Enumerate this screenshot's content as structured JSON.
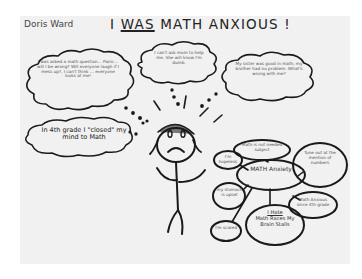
{
  "drawing": {
    "author": "Doris Ward",
    "title_prefix": "I ",
    "title_underlined": "WAS",
    "title_suffix": " MATH ANXIOUS !",
    "thought_bubbles": [
      {
        "id": "asked-question",
        "text": "I was asked a math question... Panic... will I be wrong? Will everyone laugh if I mess up?, I can't think ... everyone looks at me!"
      },
      {
        "id": "ask-mom",
        "text": "I can't ask mom to help me. She will know I'm dumb."
      },
      {
        "id": "sister-brother",
        "text": "My sister was good in math, my brother had no problem. What's wrong with me?"
      },
      {
        "id": "closed-mind",
        "text": "In 4th grade I \"closed\" my mind to Math"
      }
    ],
    "mind_map": {
      "center": "MATH Anxiety",
      "nodes": [
        {
          "id": "math-is-not",
          "text": "Math is not needed subject"
        },
        {
          "id": "im-hopeless",
          "text": "I'm hopeless"
        },
        {
          "id": "tune-out",
          "text": "Tune out at the mention of numbers"
        },
        {
          "id": "stomach-upset",
          "text": "my stomach is upset"
        },
        {
          "id": "since-4th",
          "text": "Math Anxious since 4th grade"
        },
        {
          "id": "im-scared",
          "text": "I'm scared"
        },
        {
          "id": "i-hate",
          "title": "I Hate",
          "text": "Math Races My Brain Stalls"
        }
      ]
    },
    "colors": {
      "paper": "#f1f1f1",
      "ink": "#1a1a1a",
      "pencil": "#555555",
      "hair": "#777777"
    }
  }
}
